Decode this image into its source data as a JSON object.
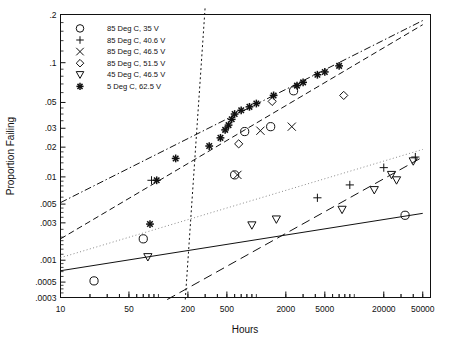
{
  "chart_data": {
    "type": "scatter",
    "title": "",
    "xlabel": "Hours",
    "ylabel": "Proportion Failing",
    "xscale": "log",
    "yscale": "probability-lognormal",
    "grid": false,
    "legend_position": "top-left-inside",
    "xlim": [
      10,
      60000
    ],
    "ylim": [
      0.0003,
      0.2
    ],
    "xticks": [
      "10",
      "50",
      "200",
      "500",
      "2000",
      "5000",
      "20000",
      "50000"
    ],
    "xtick_values": [
      10,
      50,
      200,
      500,
      2000,
      5000,
      20000,
      50000
    ],
    "yticks": [
      ".2",
      ".1",
      ".05",
      ".03",
      ".02",
      ".01",
      ".005",
      ".003",
      ".001",
      ".0005",
      ".0003"
    ],
    "ytick_values": [
      0.2,
      0.1,
      0.05,
      0.03,
      0.02,
      0.01,
      0.005,
      0.003,
      0.001,
      0.0005,
      0.0003
    ],
    "series": [
      {
        "name": "85 Deg C, 35 V",
        "marker": "circle",
        "line_style": "solid",
        "points": [
          {
            "x": 22,
            "y": 0.00052
          },
          {
            "x": 70,
            "y": 0.0019
          },
          {
            "x": 600,
            "y": 0.0105
          },
          {
            "x": 760,
            "y": 0.028
          },
          {
            "x": 1400,
            "y": 0.031
          },
          {
            "x": 2400,
            "y": 0.062
          },
          {
            "x": 33000,
            "y": 0.0037
          }
        ],
        "fit_line": {
          "x1": 10,
          "y1": 0.00072,
          "x2": 50000,
          "y2": 0.0039
        }
      },
      {
        "name": "85 Deg C, 40.6 V",
        "marker": "plus",
        "line_style": "dotted",
        "points": [
          {
            "x": 85,
            "y": 0.0092
          },
          {
            "x": 4200,
            "y": 0.0059
          },
          {
            "x": 9000,
            "y": 0.0082
          },
          {
            "x": 20000,
            "y": 0.0125
          },
          {
            "x": 42000,
            "y": 0.016
          }
        ],
        "fit_line": {
          "x1": 10,
          "y1": 0.00108,
          "x2": 50000,
          "y2": 0.019
        }
      },
      {
        "name": "85 Deg C, 46.5 V",
        "marker": "cross",
        "line_style": "dotted-steep",
        "points": [
          {
            "x": 640,
            "y": 0.0105
          },
          {
            "x": 1100,
            "y": 0.0285
          },
          {
            "x": 2300,
            "y": 0.031
          }
        ],
        "fit_line": {
          "x1": 188,
          "y1": 0.00028,
          "x2": 300,
          "y2": 0.22
        }
      },
      {
        "name": "85 Deg C, 51.5 V",
        "marker": "diamond",
        "line_style": "dashed",
        "points": [
          {
            "x": 660,
            "y": 0.0215
          },
          {
            "x": 1450,
            "y": 0.051
          },
          {
            "x": 7800,
            "y": 0.057
          }
        ],
        "fit_line": {
          "x1": 10,
          "y1": 0.0019,
          "x2": 50000,
          "y2": 0.175
        }
      },
      {
        "name": "45 Deg C, 46.5 V",
        "marker": "triangle-down",
        "line_style": "long-dash",
        "points": [
          {
            "x": 78,
            "y": 0.0011
          },
          {
            "x": 900,
            "y": 0.0028
          },
          {
            "x": 1600,
            "y": 0.0033
          },
          {
            "x": 7500,
            "y": 0.0043
          },
          {
            "x": 16000,
            "y": 0.0072
          },
          {
            "x": 24000,
            "y": 0.0105
          },
          {
            "x": 27000,
            "y": 0.0092
          },
          {
            "x": 40000,
            "y": 0.0145
          }
        ],
        "fit_line": {
          "x1": 123,
          "y1": 0.00028,
          "x2": 50000,
          "y2": 0.016
        }
      },
      {
        "name": "5 Deg C, 62.5 V",
        "marker": "asterisk",
        "line_style": "dash-dot",
        "points": [
          {
            "x": 82,
            "y": 0.0029
          },
          {
            "x": 96,
            "y": 0.0092
          },
          {
            "x": 150,
            "y": 0.0155
          },
          {
            "x": 330,
            "y": 0.0205
          },
          {
            "x": 430,
            "y": 0.0245
          },
          {
            "x": 480,
            "y": 0.029
          },
          {
            "x": 520,
            "y": 0.032
          },
          {
            "x": 560,
            "y": 0.036
          },
          {
            "x": 600,
            "y": 0.04
          },
          {
            "x": 700,
            "y": 0.043
          },
          {
            "x": 850,
            "y": 0.046
          },
          {
            "x": 1000,
            "y": 0.049
          },
          {
            "x": 1500,
            "y": 0.057
          },
          {
            "x": 2600,
            "y": 0.068
          },
          {
            "x": 3000,
            "y": 0.072
          },
          {
            "x": 4200,
            "y": 0.082
          },
          {
            "x": 5000,
            "y": 0.086
          },
          {
            "x": 7000,
            "y": 0.095
          }
        ],
        "fit_line": {
          "x1": 10,
          "y1": 0.0052,
          "x2": 50000,
          "y2": 0.185
        }
      }
    ]
  },
  "legend": {
    "entries": [
      {
        "marker": "circle",
        "label": "85 Deg C, 35 V"
      },
      {
        "marker": "plus",
        "label": "85 Deg C, 40.6 V"
      },
      {
        "marker": "cross",
        "label": "85 Deg C, 46.5 V"
      },
      {
        "marker": "diamond",
        "label": "85 Deg C, 51.5 V"
      },
      {
        "marker": "triangle-down",
        "label": "45 Deg C, 46.5 V"
      },
      {
        "marker": "asterisk",
        "label": "5 Deg C, 62.5 V"
      }
    ]
  },
  "axes": {
    "x_title": "Hours",
    "y_title": "Proportion Failing",
    "x_tick_labels": [
      "10",
      "50",
      "200",
      "500",
      "2000",
      "5000",
      "20000",
      "50000"
    ],
    "y_tick_labels": [
      ".2",
      ".1",
      ".05",
      ".03",
      ".02",
      ".01",
      ".005",
      ".003",
      ".001",
      ".0005",
      ".0003"
    ]
  },
  "colors": {
    "ink": "#111111",
    "background": "#ffffff",
    "faint": "#777777"
  }
}
